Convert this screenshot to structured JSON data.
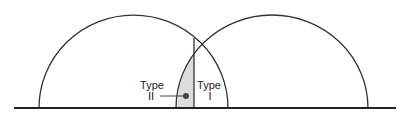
{
  "diagram": {
    "labels": {
      "type_ii_line1": "Type",
      "type_ii_line2": "II",
      "type_i_line1": "Type",
      "type_i_line2": "I"
    },
    "colors": {
      "stroke": "#333333",
      "shaded_region": "#dcdcdc",
      "dot": "#444444"
    }
  }
}
